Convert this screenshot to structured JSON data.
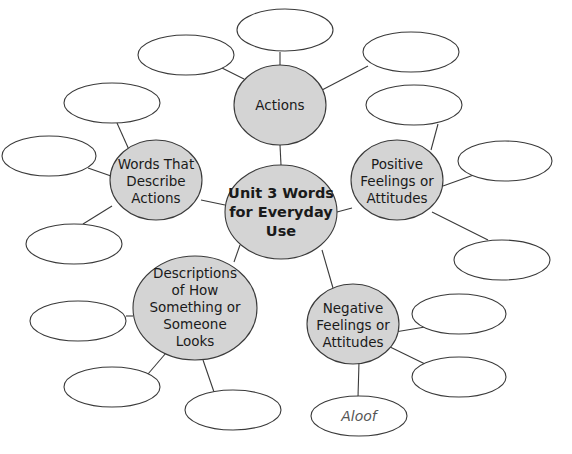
{
  "diagram": {
    "type": "word-web",
    "colors": {
      "hub_fill": "#d4d4d4",
      "outline": "#3a3a3a",
      "background": "#ffffff"
    },
    "center": {
      "label": "Unit 3 Words for Everyday Use",
      "lines": [
        "Unit 3 Words",
        "for Everyday",
        "Use"
      ]
    },
    "categories": [
      {
        "id": "actions",
        "label": "Actions",
        "lines": [
          "Actions"
        ],
        "answers": [
          "",
          "",
          ""
        ]
      },
      {
        "id": "positive",
        "label": "Positive Feelings or Attitudes",
        "lines": [
          "Positive",
          "Feelings or",
          "Attitudes"
        ],
        "answers": [
          "",
          "",
          ""
        ]
      },
      {
        "id": "negative",
        "label": "Negative Feelings or Attitudes",
        "lines": [
          "Negative",
          "Feelings or",
          "Attitudes"
        ],
        "answers": [
          "",
          "",
          "Aloof"
        ]
      },
      {
        "id": "descriptions",
        "label": "Descriptions of How Something or Someone Looks",
        "lines": [
          "Descriptions",
          "of How",
          "Something or",
          "Someone",
          "Looks"
        ],
        "answers": [
          "",
          "",
          ""
        ]
      },
      {
        "id": "words-describe",
        "label": "Words That Describe Actions",
        "lines": [
          "Words That",
          "Describe",
          "Actions"
        ],
        "answers": [
          "",
          "",
          ""
        ]
      }
    ]
  }
}
